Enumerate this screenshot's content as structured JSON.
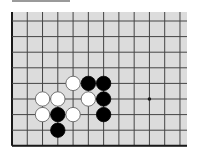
{
  "diagram": {
    "type": "go-board-fragment",
    "colors": {
      "board": "#dcdcdc",
      "line": "#444444",
      "edge": "#1a1a1a",
      "black_stone": "#000000",
      "white_stone": "#ffffff",
      "header_bar": "#9a9a9a"
    },
    "grid": {
      "columns": 12,
      "rows": 9,
      "left_edge_visible": true,
      "bottom_edge_visible": true
    },
    "star_points": [
      {
        "col": 9,
        "row": 5
      }
    ],
    "stones": [
      {
        "color": "white",
        "col": 4,
        "row": 4
      },
      {
        "color": "black",
        "col": 5,
        "row": 4
      },
      {
        "color": "black",
        "col": 6,
        "row": 4
      },
      {
        "color": "white",
        "col": 2,
        "row": 5
      },
      {
        "color": "white",
        "col": 3,
        "row": 5
      },
      {
        "color": "white",
        "col": 5,
        "row": 5
      },
      {
        "color": "black",
        "col": 6,
        "row": 5
      },
      {
        "color": "white",
        "col": 2,
        "row": 6
      },
      {
        "color": "black",
        "col": 3,
        "row": 6
      },
      {
        "color": "white",
        "col": 4,
        "row": 6
      },
      {
        "color": "black",
        "col": 6,
        "row": 6
      },
      {
        "color": "black",
        "col": 3,
        "row": 7
      }
    ]
  }
}
